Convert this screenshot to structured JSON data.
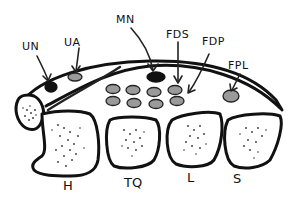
{
  "diagram": {
    "labels": {
      "UN": "UN",
      "UA": "UA",
      "MN": "MN",
      "FDS": "FDS",
      "FDP": "FDP",
      "FPL": "FPL",
      "H": "H",
      "TQ": "TQ",
      "L": "L",
      "S": "S"
    },
    "structures": [
      {
        "key": "UN",
        "meaning": "ulnar nerve",
        "fill": "#111111"
      },
      {
        "key": "UA",
        "meaning": "ulnar artery",
        "fill": "#9a9a9a"
      },
      {
        "key": "MN",
        "meaning": "median nerve",
        "fill": "#111111"
      },
      {
        "key": "FDS",
        "meaning": "flexor digitorum superficialis tendons",
        "fill": "#9a9a9a"
      },
      {
        "key": "FDP",
        "meaning": "flexor digitorum profundus tendons",
        "fill": "#9a9a9a"
      },
      {
        "key": "FPL",
        "meaning": "flexor pollicis longus tendon",
        "fill": "#9a9a9a"
      },
      {
        "key": "H",
        "meaning": "hamate"
      },
      {
        "key": "TQ",
        "meaning": "triquetrum"
      },
      {
        "key": "L",
        "meaning": "lunate"
      },
      {
        "key": "S",
        "meaning": "scaphoid"
      }
    ],
    "colors": {
      "stroke": "#111111",
      "tendon_fill": "#9a9a9a",
      "nerve_fill": "#111111",
      "background": "#ffffff"
    }
  }
}
